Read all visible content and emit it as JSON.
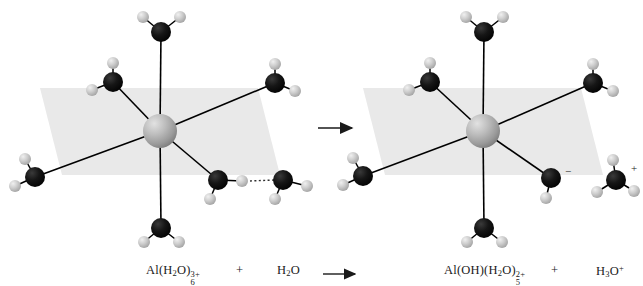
{
  "figure": {
    "background_color": "#ffffff"
  },
  "palette": {
    "aluminium": "#a9a9a9",
    "aluminium_highlight": "#d8d8d8",
    "oxygen": "#111111",
    "hydrogen": "#c4c4c4",
    "hydrogen_highlight": "#e8e8e8",
    "plane": "#e9e9e9",
    "bond": "#000000",
    "hbond": "#3a3a3a",
    "text": "#1a1a1a"
  },
  "equation": {
    "reactant_complex": {
      "element": "Al",
      "open_paren": "(",
      "ligand": "H",
      "ligand_sub": "2",
      "ligand_rest": "O",
      "close_paren": ")",
      "ligand_count": "6",
      "charge": "3+",
      "full_text": "Al(H2O)6 3+"
    },
    "plus_left": "+",
    "reactant_water": {
      "prefix": "H",
      "sub": "2",
      "suffix": "O",
      "full_text": "H2O"
    },
    "arrow": "→",
    "product_complex": {
      "element": "Al",
      "hydroxide": "(OH)",
      "open_paren": "(",
      "ligand": "H",
      "ligand_sub": "2",
      "ligand_rest": "O",
      "close_paren": ")",
      "ligand_count": "5",
      "charge": "2+",
      "full_text": "Al(OH)(H2O)5 2+"
    },
    "plus_right": "+",
    "product_hydronium": {
      "prefix": "H",
      "sub": "3",
      "suffix": "O",
      "charge": "+",
      "full_text": "H3O+"
    }
  },
  "annotations": {
    "negative_charge": "−",
    "positive_charge": "+"
  },
  "left_structure": {
    "label": "Al(H2O)6 3+ octahedral complex with incoming water",
    "center": {
      "name": "aluminium-center",
      "x": 160,
      "y": 131,
      "r": 17
    },
    "plane": {
      "name": "equatorial-plane",
      "points": "62,175 40,88 258,88 280,175"
    },
    "ligands": [
      {
        "name": "water-axial-top",
        "x": 161,
        "y": 32,
        "r": 10,
        "hydrogens": [
          {
            "x": 143,
            "y": 17,
            "r": 6
          },
          {
            "x": 180,
            "y": 17,
            "r": 6
          }
        ]
      },
      {
        "name": "water-upper-left",
        "x": 113,
        "y": 82,
        "r": 10,
        "hydrogens": [
          {
            "x": 113,
            "y": 63,
            "r": 6
          },
          {
            "x": 92,
            "y": 90,
            "r": 6
          }
        ]
      },
      {
        "name": "water-upper-right",
        "x": 275,
        "y": 83,
        "r": 10,
        "hydrogens": [
          {
            "x": 275,
            "y": 64,
            "r": 6
          },
          {
            "x": 295,
            "y": 91,
            "r": 6
          }
        ]
      },
      {
        "name": "water-lower-left",
        "x": 35,
        "y": 177,
        "r": 10,
        "hydrogens": [
          {
            "x": 25,
            "y": 159,
            "r": 6
          },
          {
            "x": 15,
            "y": 186,
            "r": 6
          }
        ]
      },
      {
        "name": "water-lower-right",
        "x": 218,
        "y": 180,
        "r": 10,
        "hydrogens": [
          {
            "x": 242,
            "y": 181,
            "r": 6
          },
          {
            "x": 210,
            "y": 199,
            "r": 6
          }
        ]
      },
      {
        "name": "water-axial-bottom",
        "x": 161,
        "y": 228,
        "r": 10,
        "hydrogens": [
          {
            "x": 144,
            "y": 242,
            "r": 6
          },
          {
            "x": 179,
            "y": 242,
            "r": 6
          }
        ]
      }
    ],
    "free_water": {
      "name": "incoming-water-molecule",
      "x": 283,
      "y": 180,
      "r": 10,
      "hydrogens": [
        {
          "x": 307,
          "y": 186,
          "r": 6
        },
        {
          "x": 275,
          "y": 199,
          "r": 6
        }
      ]
    },
    "hydrogen_bond": {
      "name": "hydrogen-bond",
      "x1": 250,
      "y1": 181,
      "x2": 274,
      "y2": 180
    }
  },
  "right_structure": {
    "label": "Al(OH)(H2O)5 2+ octahedral complex",
    "center": {
      "name": "aluminium-center",
      "x": 483,
      "y": 131,
      "r": 17
    },
    "plane": {
      "name": "equatorial-plane",
      "points": "385,175 363,88 581,88 603,175"
    },
    "ligands": [
      {
        "name": "water-axial-top",
        "x": 484,
        "y": 32,
        "r": 10,
        "hydrogens": [
          {
            "x": 466,
            "y": 17,
            "r": 6
          },
          {
            "x": 503,
            "y": 17,
            "r": 6
          }
        ]
      },
      {
        "name": "water-upper-left",
        "x": 430,
        "y": 82,
        "r": 10,
        "hydrogens": [
          {
            "x": 430,
            "y": 63,
            "r": 6
          },
          {
            "x": 409,
            "y": 90,
            "r": 6
          }
        ]
      },
      {
        "name": "water-upper-right",
        "x": 593,
        "y": 83,
        "r": 10,
        "hydrogens": [
          {
            "x": 593,
            "y": 64,
            "r": 6
          },
          {
            "x": 613,
            "y": 91,
            "r": 6
          }
        ]
      },
      {
        "name": "water-lower-left",
        "x": 363,
        "y": 176,
        "r": 10,
        "hydrogens": [
          {
            "x": 353,
            "y": 158,
            "r": 6
          },
          {
            "x": 343,
            "y": 185,
            "r": 6
          }
        ]
      },
      {
        "name": "hydroxide-ligand",
        "x": 551,
        "y": 178,
        "r": 10,
        "hydrogens": [
          {
            "x": 546,
            "y": 198,
            "r": 6
          }
        ]
      },
      {
        "name": "water-axial-bottom",
        "x": 484,
        "y": 228,
        "r": 10,
        "hydrogens": [
          {
            "x": 467,
            "y": 242,
            "r": 6
          },
          {
            "x": 502,
            "y": 242,
            "r": 6
          }
        ]
      }
    ],
    "hydronium": {
      "name": "hydronium-ion",
      "x": 616,
      "y": 180,
      "r": 10,
      "hydrogens": [
        {
          "x": 613,
          "y": 160,
          "r": 6
        },
        {
          "x": 597,
          "y": 192,
          "r": 6
        },
        {
          "x": 634,
          "y": 191,
          "r": 6
        }
      ]
    }
  },
  "reaction_arrow": {
    "name": "reaction-arrow",
    "x1": 318,
    "y1": 128,
    "x2": 353,
    "y2": 128
  }
}
